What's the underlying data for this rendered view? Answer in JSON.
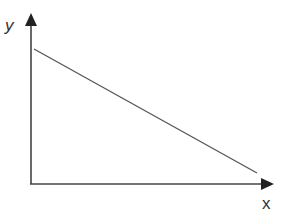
{
  "diagram": {
    "type": "line-graph-sketch",
    "axes": {
      "x": {
        "label": "x"
      },
      "y": {
        "label": "y"
      }
    },
    "line": {
      "description": "straight line with negative slope, starting high on the y-axis and decreasing toward the x-axis",
      "start": {
        "x": 34,
        "y": 49
      },
      "end": {
        "x": 257,
        "y": 173
      }
    },
    "colors": {
      "axis": "#333333",
      "line": "#555555",
      "background": "#ffffff"
    }
  }
}
